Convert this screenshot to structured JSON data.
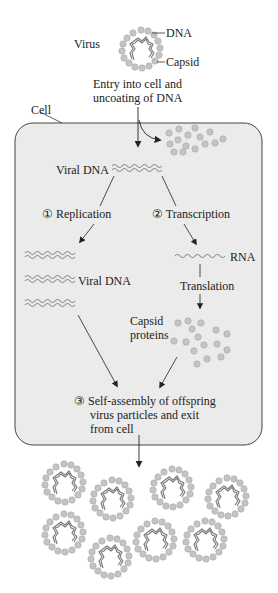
{
  "top": {
    "virus_label": "Virus",
    "dna_label": "DNA",
    "capsid_label": "Capsid",
    "entry_line1": "Entry into cell and",
    "entry_line2": "uncoating of DNA"
  },
  "cell": {
    "label": "Cell",
    "viral_dna_label": "Viral DNA",
    "replication": "① Replication",
    "transcription": "② Transcription",
    "rna_label": "RNA",
    "replicated_dna_label": "Viral DNA",
    "translation": "Translation",
    "capsid_proteins_line1": "Capsid",
    "capsid_proteins_line2": "proteins",
    "assembly_line1": "③ Self-assembly of offspring",
    "assembly_line2": "virus particles and exit",
    "assembly_line3": "from cell"
  },
  "colors": {
    "cell_fill": "#ebebeb",
    "cell_stroke": "#444444",
    "capsomere": "#bdbdbd",
    "capsomere_stroke": "#a8a8a8",
    "dna": "#8a8a8a",
    "arrow": "#222222"
  },
  "offspring_count": 8
}
